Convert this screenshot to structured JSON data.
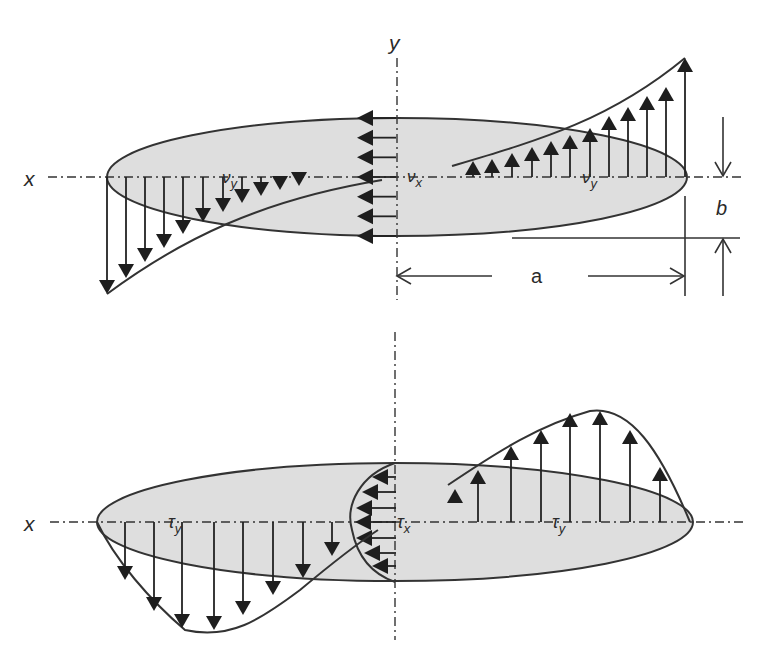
{
  "figure": {
    "type": "technical-diagram",
    "colors": {
      "plate_fill": "#dedede",
      "stroke": "#333333",
      "arrow": "#1e1e1e",
      "background": "#ffffff"
    }
  },
  "top_panel": {
    "axis_labels": {
      "x": "x",
      "y": "y"
    },
    "component_labels": {
      "vy_left": "ν",
      "vy_left_sub": "y",
      "vx": "ν",
      "vx_sub": "x",
      "vy_right": "ν",
      "vy_right_sub": "y"
    },
    "dimension_labels": {
      "a": "a",
      "b": "b"
    },
    "distributions": {
      "vy_left": {
        "direction": "down",
        "arrow_count": 13,
        "shape": "grows toward left tip"
      },
      "vx": {
        "direction": "left",
        "arrow_count": 7,
        "shape": "uniform along y-axis"
      },
      "vy_right": {
        "direction": "up",
        "arrow_count": 13,
        "shape": "grows toward right tip"
      }
    }
  },
  "bottom_panel": {
    "axis_labels": {
      "x": "x"
    },
    "component_labels": {
      "ty_left": "τ",
      "ty_left_sub": "y",
      "tx": "τ",
      "tx_sub": "x",
      "ty_right": "τ",
      "ty_right_sub": "y"
    },
    "distributions": {
      "ty_left": {
        "direction": "down",
        "arrow_count": 10,
        "shape": "bulged, peak near mid-span"
      },
      "tx": {
        "direction": "left",
        "arrow_count": 8,
        "shape": "semi-elliptical along y-axis"
      },
      "ty_right": {
        "direction": "up",
        "arrow_count": 8,
        "shape": "bulged, peak near mid-span"
      }
    }
  }
}
